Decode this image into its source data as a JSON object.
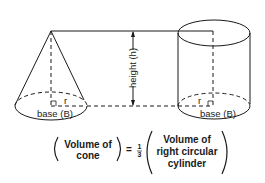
{
  "diagram": {
    "cone": {
      "base_label": "base (B)",
      "radius_label": "r"
    },
    "cylinder": {
      "base_label": "base (B)",
      "radius_label": "r"
    },
    "height_label": "height (h)",
    "formula": {
      "left_line1": "Volume of",
      "left_line2": "cone",
      "equals": "=",
      "frac_num": "1",
      "frac_den": "3",
      "right_line1": "Volume of",
      "right_line2": "right circular",
      "right_line3": "cylinder"
    },
    "colors": {
      "ink": "#1a1a1a",
      "background": "#ffffff"
    }
  }
}
